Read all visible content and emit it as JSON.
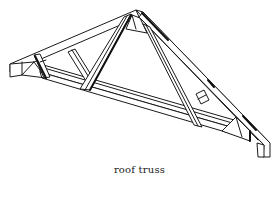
{
  "figure": {
    "caption": "roof truss",
    "colors": {
      "line": "#1a1a1a",
      "background": "#ffffff",
      "caption": "#222222"
    },
    "parts": [
      "top-chord-left",
      "top-chord-right",
      "bottom-chord",
      "web-left-outer",
      "web-left-inner",
      "web-right-inner",
      "web-right-outer",
      "heel-block-left",
      "heel-block-right",
      "apex-gusset"
    ]
  }
}
